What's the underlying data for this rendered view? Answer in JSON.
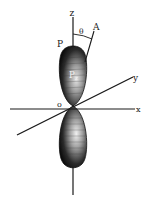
{
  "diagram": {
    "labels": {
      "z_axis": "z",
      "x_axis": "x",
      "y_axis": "y",
      "origin": "o",
      "point_A": "A",
      "angle": "θ",
      "P": "P",
      "orbital": "P",
      "orbital_sub": "z"
    },
    "colors": {
      "line": "#1a1a1a",
      "lobe_dark": "#111111",
      "lobe_light": "#e8e8e8",
      "background": "#ffffff"
    }
  }
}
